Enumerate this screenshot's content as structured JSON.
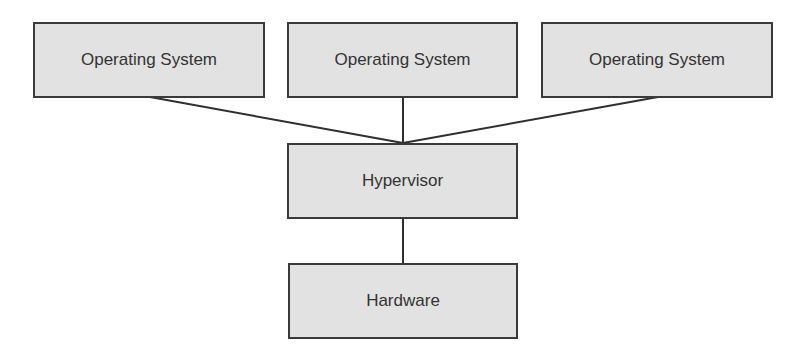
{
  "diagram": {
    "type": "virtualization-architecture",
    "os_boxes": [
      {
        "label": "Operating System"
      },
      {
        "label": "Operating System"
      },
      {
        "label": "Operating System"
      }
    ],
    "hypervisor": {
      "label": "Hypervisor"
    },
    "hardware": {
      "label": "Hardware"
    },
    "edges": [
      {
        "from": "Operating System 1",
        "to": "Hypervisor"
      },
      {
        "from": "Operating System 2",
        "to": "Hypervisor"
      },
      {
        "from": "Operating System 3",
        "to": "Hypervisor"
      },
      {
        "from": "Hypervisor",
        "to": "Hardware"
      }
    ],
    "colors": {
      "box_fill": "#e2e2e2",
      "border": "#3a3a3a",
      "text": "#333333",
      "background": "#ffffff"
    }
  }
}
